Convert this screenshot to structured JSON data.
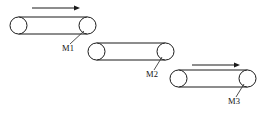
{
  "figure": {
    "background_color": "#ffffff",
    "stroke_color": "#1a1a1a",
    "label_color": "#111111",
    "width": 272,
    "height": 116
  },
  "conveyors": [
    {
      "id": "conveyor-1",
      "label": "M1",
      "left_roller": {
        "cx": 18.5,
        "cy": 25.5,
        "r": 8.5
      },
      "right_roller": {
        "cx": 87.5,
        "cy": 25.5,
        "r": 8.5
      },
      "belt_top_y": 17,
      "belt_bottom_y": 34,
      "belt_x_start": 18.5,
      "belt_x_end": 87.5,
      "label_x": 62,
      "label_y": 51,
      "leader_from_x": 84,
      "leader_from_y": 31,
      "leader_to_x": 70,
      "leader_to_y": 44,
      "has_arrow": true,
      "arrow_y": 8,
      "arrow_x_start": 32,
      "arrow_x_end": 80,
      "arrow_direction": "right"
    },
    {
      "id": "conveyor-2",
      "label": "M2",
      "left_roller": {
        "cx": 96.5,
        "cy": 51.5,
        "r": 8.5
      },
      "right_roller": {
        "cx": 165.5,
        "cy": 51.5,
        "r": 8.5
      },
      "belt_top_y": 43,
      "belt_bottom_y": 60,
      "belt_x_start": 96.5,
      "belt_x_end": 165.5,
      "label_x": 146,
      "label_y": 77,
      "leader_from_x": 162,
      "leader_from_y": 57,
      "leader_to_x": 154,
      "leader_to_y": 70,
      "has_arrow": false,
      "arrow_y": 0,
      "arrow_x_start": 0,
      "arrow_x_end": 0,
      "arrow_direction": "none"
    },
    {
      "id": "conveyor-3",
      "label": "M3",
      "left_roller": {
        "cx": 178.5,
        "cy": 78.5,
        "r": 8.5
      },
      "right_roller": {
        "cx": 247.5,
        "cy": 78.5,
        "r": 8.5
      },
      "belt_top_y": 70,
      "belt_bottom_y": 87,
      "belt_x_start": 178.5,
      "belt_x_end": 247.5,
      "label_x": 228,
      "label_y": 104,
      "leader_from_x": 244,
      "leader_from_y": 84,
      "leader_to_x": 236,
      "leader_to_y": 97,
      "has_arrow": true,
      "arrow_y": 65,
      "arrow_x_start": 192,
      "arrow_x_end": 240,
      "arrow_direction": "right"
    }
  ]
}
